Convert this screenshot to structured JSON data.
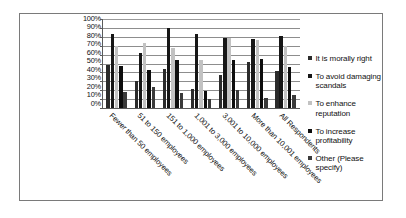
{
  "chart_data": {
    "type": "bar",
    "title": "",
    "xlabel": "",
    "ylabel": "",
    "ylim": [
      0,
      100
    ],
    "grid": true,
    "legend_position": "right",
    "ytick_labels": [
      "100%",
      "90%",
      "80%",
      "70%",
      "60%",
      "50%",
      "40%",
      "30%",
      "20%",
      "10%",
      "0%"
    ],
    "categories": [
      "Fewer than 50 employees",
      "51 to 150 employees",
      "151 to 1,000 employees",
      "1,001 to 3,000 employees",
      "3,001 to 10,000 employees",
      "More than 10,001 employees",
      "All Respondents"
    ],
    "series": [
      {
        "name": "It is morally right",
        "color": "#2b2b2b",
        "values": [
          48,
          30,
          44,
          21,
          37,
          52,
          42
        ]
      },
      {
        "name": "To avoid damaging scandals",
        "color": "#161616",
        "values": [
          83,
          62,
          90,
          83,
          79,
          77,
          81
        ]
      },
      {
        "name": "To enhance reputation",
        "color": "#c2c2c2",
        "values": [
          70,
          73,
          67,
          54,
          79,
          76,
          70
        ]
      },
      {
        "name": "To increase profitability",
        "color": "#0d0d0d",
        "values": [
          47,
          43,
          54,
          19,
          54,
          55,
          46
        ]
      },
      {
        "name": "Other (Please specify)",
        "color": "#3a3a3a",
        "values": [
          18,
          24,
          17,
          10,
          20,
          11,
          15
        ]
      }
    ]
  }
}
